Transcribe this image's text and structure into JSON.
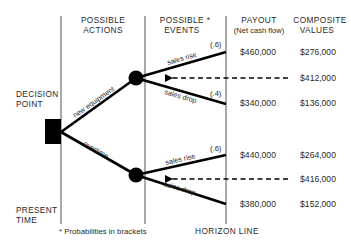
{
  "headers": {
    "actions_line1": "POSSIBLE",
    "actions_line2": "ACTIONS",
    "events_line1": "POSSIBLE *",
    "events_line2": "EVENTS",
    "payout_line1": "PAYOUT",
    "payout_line2": "(Net cash flow)",
    "composite_line1": "COMPOSITE",
    "composite_line2": "VALUES"
  },
  "labels": {
    "decision_point_line1": "DECISION",
    "decision_point_line2": "POINT",
    "present_time_line1": "PRESENT",
    "present_time_line2": "TIME",
    "horizon_line": "HORIZON LINE",
    "footnote": "* Probabilities in brackets"
  },
  "actions": [
    {
      "label": "new equipment",
      "expected_value": "$412,000",
      "events": [
        {
          "label": "sales rise",
          "probability": "(.6)",
          "payout": "$460,000",
          "composite": "$276,000"
        },
        {
          "label": "sales drop",
          "probability": "(.4)",
          "payout": "$340,000",
          "composite": "$136,000"
        }
      ]
    },
    {
      "label": "overtime",
      "expected_value": "$416,000",
      "events": [
        {
          "label": "sales rise",
          "probability": "(.6)",
          "payout": "$440,000",
          "composite": "$264,000"
        },
        {
          "label": "sales drop",
          "probability": "",
          "payout": "$380,000",
          "composite": "$152,000"
        }
      ]
    }
  ],
  "colors": {
    "ink": "#000000",
    "text": "#2a2a2a",
    "guide_line": "#555555",
    "background": "#ffffff"
  }
}
